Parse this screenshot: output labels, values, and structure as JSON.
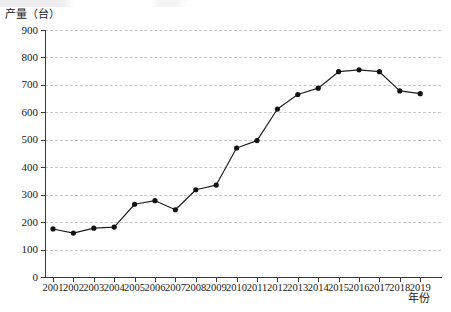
{
  "chart_data": {
    "type": "line",
    "title": "",
    "xlabel": "年份",
    "ylabel": "产量（台）",
    "categories": [
      "2001",
      "2002",
      "2003",
      "2004",
      "2005",
      "2006",
      "2007",
      "2008",
      "2009",
      "2010",
      "2011",
      "2012",
      "2013",
      "2014",
      "2015",
      "2016",
      "2017",
      "2018",
      "2019"
    ],
    "values": [
      175,
      160,
      178,
      182,
      265,
      278,
      245,
      318,
      335,
      470,
      497,
      612,
      665,
      688,
      748,
      755,
      748,
      678,
      668
    ],
    "series": [
      {
        "name": "产量",
        "values": [
          175,
          160,
          178,
          182,
          265,
          278,
          245,
          318,
          335,
          470,
          497,
          612,
          665,
          688,
          748,
          755,
          748,
          678,
          668
        ]
      }
    ],
    "ylim": [
      0,
      900
    ],
    "yticks": [
      0,
      100,
      200,
      300,
      400,
      500,
      600,
      700,
      800,
      900
    ],
    "ytick_labels": [
      "0",
      "100",
      "200",
      "300",
      "400",
      "500",
      "600",
      "700",
      "800",
      "900"
    ],
    "grid": "horizontal-dashed",
    "legend": "none",
    "marker": "filled-circle",
    "line_color": "#222222",
    "marker_color": "#111111",
    "grid_color": "#c9c9c9",
    "axis_color": "#3a3a3a"
  },
  "axes": {
    "y_title": "产量（台）",
    "x_title": "年份"
  }
}
